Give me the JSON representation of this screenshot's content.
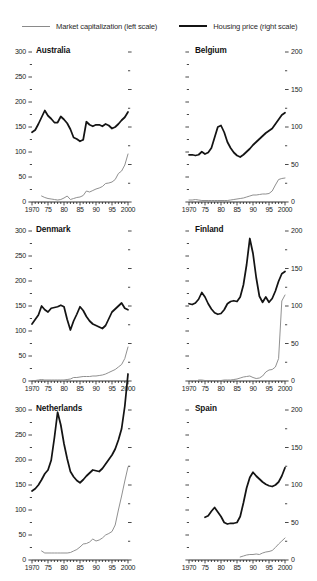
{
  "legend": {
    "market_cap_label": "Market capitalization (left scale)",
    "housing_label": "Housing price (right scale)",
    "market_cap_color": "#8a8a8a",
    "housing_color": "#141414"
  },
  "axes": {
    "left_ticks": [
      "0",
      "50",
      "100",
      "150",
      "200",
      "250",
      "300"
    ],
    "right_ticks": [
      "0",
      "50",
      "100",
      "150",
      "200"
    ],
    "x_ticks": [
      "1970",
      "75",
      "80",
      "85",
      "90",
      "95",
      "2000"
    ]
  },
  "chart_data": {
    "type": "line",
    "title": "",
    "xlabel": "",
    "ylabel": "",
    "x": [
      1970,
      1971,
      1972,
      1973,
      1974,
      1975,
      1976,
      1977,
      1978,
      1979,
      1980,
      1981,
      1982,
      1983,
      1984,
      1985,
      1986,
      1987,
      1988,
      1989,
      1990,
      1991,
      1992,
      1993,
      1994,
      1995,
      1996,
      1997,
      1998,
      1999,
      2000
    ],
    "xlim": [
      1970,
      2000
    ],
    "left_scale": {
      "label": "Market capitalization (left scale)",
      "ylim": [
        0,
        300
      ],
      "major_step": 50,
      "minor_step": 25
    },
    "right_scale": {
      "label": "Housing price (right scale)",
      "ylim": [
        0,
        200
      ],
      "major_step": 50,
      "minor_step": 25
    },
    "grid": false,
    "legend_position": "top",
    "panels": [
      {
        "name": "Australia",
        "position": "top-left",
        "left_axis_labeled": true,
        "right_axis_labeled": false,
        "series": [
          {
            "name": "Housing price (right scale)",
            "axis": "right",
            "color": "#141414",
            "values": [
              93,
              96,
              104,
              113,
              122,
              115,
              111,
              106,
              106,
              114,
              110,
              105,
              97,
              86,
              84,
              81,
              83,
              107,
              103,
              101,
              103,
              103,
              101,
              104,
              102,
              98,
              100,
              104,
              109,
              113,
              120
            ]
          },
          {
            "name": "Market capitalization (left scale)",
            "axis": "left",
            "color": "#8a8a8a",
            "values": [
              null,
              null,
              null,
              12,
              9,
              7,
              6,
              5,
              4,
              5,
              8,
              12,
              5,
              7,
              9,
              10,
              13,
              22,
              20,
              23,
              26,
              28,
              31,
              37,
              38,
              40,
              45,
              57,
              62,
              74,
              96
            ]
          }
        ]
      },
      {
        "name": "Belgium",
        "position": "top-right",
        "left_axis_labeled": false,
        "right_axis_labeled": true,
        "series": [
          {
            "name": "Housing price (right scale)",
            "axis": "right",
            "color": "#141414",
            "values": [
              63,
              63,
              62,
              63,
              67,
              64,
              66,
              72,
              86,
              100,
              102,
              93,
              80,
              72,
              66,
              62,
              60,
              63,
              67,
              71,
              76,
              80,
              84,
              88,
              92,
              95,
              98,
              104,
              110,
              116,
              119
            ]
          },
          {
            "name": "Market capitalization (left scale)",
            "axis": "left",
            "color": "#8a8a8a",
            "values": [
              4,
              4,
              5,
              4,
              3,
              3,
              3,
              3,
              3,
              3,
              3,
              3,
              3,
              4,
              5,
              6,
              7,
              8,
              10,
              12,
              14,
              14,
              15,
              16,
              16,
              17,
              22,
              34,
              45,
              47,
              48
            ]
          }
        ]
      },
      {
        "name": "Denmark",
        "position": "mid-left",
        "left_axis_labeled": true,
        "right_axis_labeled": false,
        "series": [
          {
            "name": "Housing price (right scale)",
            "axis": "right",
            "color": "#141414",
            "values": [
              76,
              82,
              88,
              100,
              95,
              92,
              97,
              98,
              99,
              101,
              99,
              82,
              68,
              80,
              89,
              99,
              94,
              86,
              80,
              76,
              74,
              72,
              70,
              74,
              83,
              92,
              96,
              100,
              104,
              97,
              95
            ]
          },
          {
            "name": "Market capitalization (left scale)",
            "axis": "left",
            "color": "#8a8a8a",
            "values": [
              1,
              1,
              2,
              3,
              2,
              2,
              2,
              2,
              2,
              2,
              2,
              3,
              4,
              7,
              7,
              8,
              9,
              9,
              9,
              10,
              10,
              11,
              12,
              14,
              17,
              20,
              23,
              28,
              33,
              45,
              68
            ]
          }
        ]
      },
      {
        "name": "Finland",
        "position": "mid-right",
        "left_axis_labeled": false,
        "right_axis_labeled": true,
        "series": [
          {
            "name": "Housing price (right scale)",
            "axis": "right",
            "color": "#141414",
            "values": [
              103,
              102,
              104,
              109,
              118,
              112,
              103,
              96,
              91,
              89,
              90,
              95,
              103,
              106,
              107,
              106,
              112,
              128,
              155,
              190,
              170,
              138,
              113,
              105,
              112,
              105,
              110,
              120,
              133,
              143,
              146
            ]
          },
          {
            "name": "Market capitalization (left scale)",
            "axis": "left",
            "color": "#8a8a8a",
            "values": [
              null,
              null,
              null,
              2,
              2,
              1,
              1,
              1,
              1,
              1,
              1,
              2,
              2,
              2,
              3,
              4,
              6,
              8,
              9,
              10,
              7,
              5,
              6,
              10,
              18,
              22,
              23,
              28,
              45,
              160,
              172
            ]
          }
        ]
      },
      {
        "name": "Netherlands",
        "position": "bottom-left",
        "left_axis_labeled": true,
        "right_axis_labeled": false,
        "series": [
          {
            "name": "Housing price (right scale)",
            "axis": "right",
            "color": "#141414",
            "values": [
              92,
              95,
              100,
              107,
              115,
              120,
              133,
              163,
              197,
              180,
              155,
              135,
              118,
              111,
              106,
              103,
              107,
              112,
              116,
              120,
              119,
              118,
              122,
              128,
              134,
              140,
              148,
              160,
              175,
              205,
              248
            ]
          },
          {
            "name": "Market capitalization (left scale)",
            "axis": "left",
            "color": "#8a8a8a",
            "values": [
              null,
              null,
              null,
              18,
              14,
              14,
              14,
              14,
              14,
              14,
              14,
              14,
              15,
              18,
              21,
              26,
              32,
              33,
              36,
              42,
              38,
              40,
              44,
              50,
              53,
              57,
              70,
              100,
              128,
              158,
              186
            ]
          }
        ]
      },
      {
        "name": "Spain",
        "position": "bottom-right",
        "left_axis_labeled": false,
        "right_axis_labeled": true,
        "series": [
          {
            "name": "Housing price (right scale)",
            "axis": "right",
            "color": "#141414",
            "values": [
              null,
              null,
              null,
              null,
              null,
              57,
              59,
              65,
              70,
              64,
              58,
              50,
              48,
              49,
              49,
              50,
              58,
              76,
              96,
              110,
              117,
              112,
              108,
              104,
              101,
              99,
              98,
              100,
              104,
              112,
              123
            ]
          },
          {
            "name": "Market capitalization (left scale)",
            "axis": "left",
            "color": "#8a8a8a",
            "values": [
              null,
              null,
              null,
              null,
              null,
              null,
              null,
              null,
              null,
              null,
              null,
              null,
              null,
              null,
              null,
              null,
              6,
              8,
              10,
              11,
              11,
              12,
              11,
              14,
              16,
              17,
              19,
              25,
              32,
              38,
              44
            ]
          }
        ]
      }
    ]
  }
}
